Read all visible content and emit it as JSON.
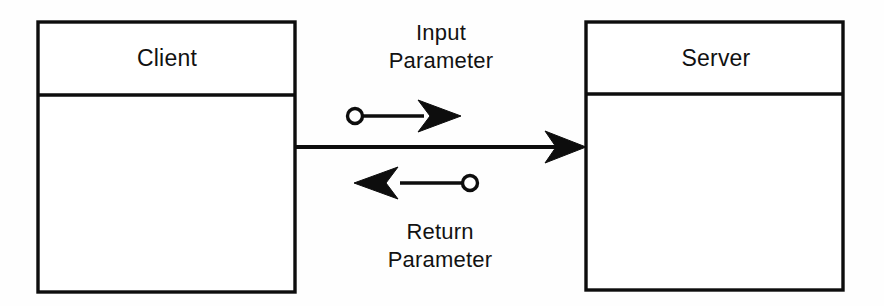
{
  "diagram": {
    "type": "uml-collaboration",
    "background_color": "#fefefe",
    "ink_color": "#0d0d0d",
    "nodes": [
      {
        "id": "client",
        "label": "Client",
        "x": 38,
        "y": 22,
        "width": 257,
        "height": 270,
        "header_height": 73
      },
      {
        "id": "server",
        "label": "Server",
        "x": 586,
        "y": 22,
        "width": 257,
        "height": 268,
        "header_height": 72
      }
    ],
    "connectors": [
      {
        "id": "call",
        "kind": "call-link",
        "from": "client",
        "to": "server",
        "arrow": "filled-triangle",
        "direction": "right",
        "y": 147
      },
      {
        "id": "input-parameter",
        "kind": "parameter-flow",
        "label_line1": "Input",
        "label_line2": "Parameter",
        "direction": "right",
        "terminal": "ball",
        "arrow": "filled-triangle",
        "y": 116
      },
      {
        "id": "return-parameter",
        "kind": "parameter-flow",
        "label_line1": "Return",
        "label_line2": "Parameter",
        "direction": "left",
        "terminal": "ball",
        "arrow": "filled-triangle",
        "y": 183
      }
    ]
  }
}
